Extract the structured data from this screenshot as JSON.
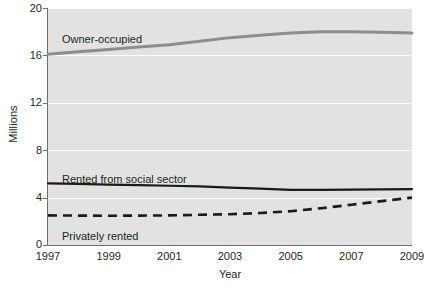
{
  "chart_data": {
    "type": "line",
    "title": "",
    "xlabel": "Year",
    "ylabel": "Millions",
    "xlim": [
      1997,
      2009
    ],
    "ylim": [
      0,
      20
    ],
    "grid": true,
    "legend_position": "inline-annotations",
    "x": [
      1997,
      1998,
      1999,
      2000,
      2001,
      2002,
      2003,
      2004,
      2005,
      2006,
      2007,
      2008,
      2009
    ],
    "xticks": [
      "1997",
      "1999",
      "2001",
      "2003",
      "2005",
      "2007",
      "2009"
    ],
    "yticks": [
      "0",
      "4",
      "8",
      "12",
      "16",
      "20"
    ],
    "series": [
      {
        "name": "Owner-occupied",
        "style": "solid",
        "color": "#8d8d8d",
        "width": 3,
        "values": [
          16.1,
          16.3,
          16.5,
          16.7,
          16.9,
          17.2,
          17.5,
          17.7,
          17.9,
          18.0,
          18.0,
          17.95,
          17.9
        ]
      },
      {
        "name": "Rented from social sector",
        "style": "solid",
        "color": "#1a1a1a",
        "width": 2.2,
        "values": [
          5.2,
          5.15,
          5.1,
          5.05,
          5.0,
          4.95,
          4.85,
          4.75,
          4.65,
          4.65,
          4.68,
          4.7,
          4.72
        ]
      },
      {
        "name": "Privately rented",
        "style": "dashed",
        "color": "#1a1a1a",
        "width": 2.6,
        "values": [
          2.5,
          2.48,
          2.47,
          2.48,
          2.5,
          2.55,
          2.6,
          2.7,
          2.85,
          3.1,
          3.4,
          3.7,
          4.0
        ]
      }
    ]
  },
  "annotations": {
    "owner_occupied": "Owner-occupied",
    "social_sector": "Rented from social sector",
    "privately_rented": "Privately rented"
  },
  "colors": {
    "plot_background": "#e2e2e2",
    "gridline": "#ffffff",
    "axis": "#6f6f6f",
    "text": "#231f20"
  }
}
